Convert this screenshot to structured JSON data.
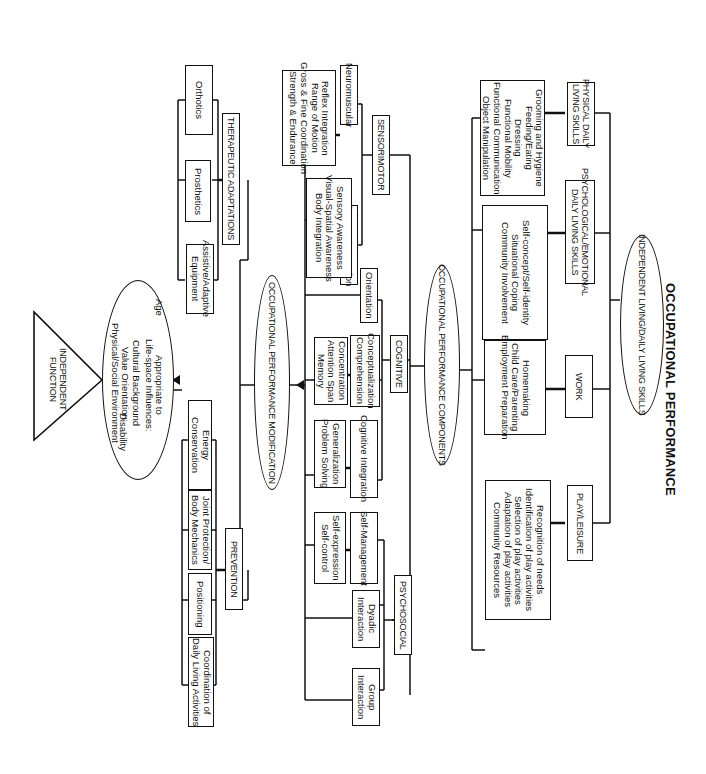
{
  "title": "OCCUPATIONAL PERFORMANCE",
  "orientation": "rotated 90 degrees clockwise",
  "top_level": {
    "label": "INDEPENDENT LIVING/DAILY LIVING SKILLS",
    "categories": [
      {
        "label": "PHYSICAL DAILY\nLIVING SKILLS",
        "items": "Grooming and Hygiene\nFeeding/Eating\nDressing\nFunctional Mobility\nFunctional Communication\nObject Manipulation"
      },
      {
        "label": "PSYCHOLOGICAL/EMOTIONAL\nDAILY LIVING SKILLS",
        "items": "Self-concept/Self-identity\nSituational Coping\nCommunity Involvement"
      },
      {
        "label": "WORK",
        "items": "Homemaking\nChild Care/Parenting\nEmployment Preparation"
      },
      {
        "label": "PLAY/LEISURE",
        "items": "Recognition of needs\nIdentification of play activities\nSelection of play activities\nAdaptation of play activities\nCommunity Resources"
      }
    ]
  },
  "components": {
    "label": "OCCUPATIONAL PERFORMANCE COMPONENTS",
    "sensorimotor": {
      "label": "SENSORIMOTOR",
      "neuromuscular": {
        "label": "Neuromuscular",
        "items": "Reflex Integration\nRange of Motion\nGross & Fine Coordination\nStrength & Endurance"
      },
      "sensory_integration": {
        "label": "Sensory Integration",
        "items": "Sensory Awareness\nVisual-Spatial Awareness\nBody Integration"
      }
    },
    "cognitive": {
      "label": "COGNITIVE",
      "orientation": {
        "label": "Orientation"
      },
      "conceptualization": {
        "label": "Conceptualization\nComprehension",
        "items": "Concentration\nAttention Span\nMemory"
      },
      "cognitive_integration": {
        "label": "Cognitive Integration",
        "items": "Generalization\nProblem Solving"
      }
    },
    "psychosocial": {
      "label": "PSYCHOSOCIAL",
      "self_management": {
        "label": "Self-Management",
        "items": "Self-expression\nSelf-control"
      },
      "dyadic": {
        "label": "Dyadic\nInteraction"
      },
      "group": {
        "label": "Group\nInteraction"
      }
    }
  },
  "modification": {
    "label": "OCCUPATIONAL PERFORMANCE MODIFICATION",
    "therapeutic": {
      "label": "THERAPEUTIC ADAPTATIONS",
      "items": [
        "Orthotics",
        "Prosthetics",
        "Assistive/Adaptive\nEquipment"
      ]
    },
    "prevention": {
      "label": "PREVENTION",
      "items": [
        "Energy\nConservation",
        "Joint Protection/\nBody Mechanics",
        "Positioning",
        "Coordination of\nDaily Living Activities"
      ]
    }
  },
  "influences": {
    "header": "Appropriate to\nLife-space Influences:",
    "left": "Age",
    "right": "Disability",
    "list": "Cultural Background\nValue Orientation\nPhysical/Social Environment"
  },
  "root": {
    "label": "INDEPENDENT\nFUNCTION"
  }
}
